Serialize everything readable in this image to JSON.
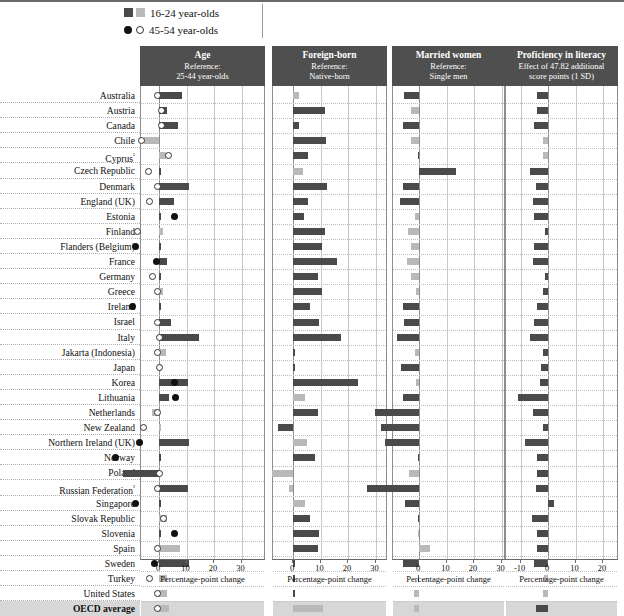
{
  "legend": {
    "items": [
      {
        "icon_dark": "dark-square-icon",
        "icon_light": "light-square-icon",
        "label": "16-24 year-olds"
      },
      {
        "icon_dark": "dark-circle-icon",
        "icon_light": "light-circle-icon",
        "label": "45-54 year-olds"
      }
    ]
  },
  "panels": [
    {
      "title": "Age",
      "sub1": "Reference:",
      "sub2": "25-44 year-olds",
      "axis_title": "Percentage-point change"
    },
    {
      "title": "Foreign-born",
      "sub1": "Reference:",
      "sub2": "Native-born",
      "axis_title": "Percentage-point change"
    },
    {
      "title": "Married women",
      "sub1": "Reference:",
      "sub2": "Single men",
      "axis_title": "Percentage-point change"
    },
    {
      "title": "Proficiency in literacy",
      "sub1": "Effect of 47.82  additional",
      "sub2": "score points (1 SD)",
      "axis_title": "Percentage-point change"
    }
  ],
  "axis_ticks": [
    -20,
    -10,
    0,
    10,
    20,
    30
  ],
  "countries": [
    "Australia",
    "Austria",
    "Canada",
    "Chile",
    "Cyprus¹",
    "Czech Republic",
    "Denmark",
    "England (UK)",
    "Estonia",
    "Finland",
    "Flanders (Belgium)",
    "France",
    "Germany",
    "Greece",
    "Ireland",
    "Israel",
    "Italy",
    "Jakarta (Indonesia)",
    "Japan",
    "Korea",
    "Lithuania",
    "Netherlands",
    "New Zealand",
    "Northern Ireland (UK)",
    "Norway",
    "Poland",
    "Russian Federation²",
    "Singapore",
    "Slovak Republic",
    "Slovenia",
    "Spain",
    "Sweden",
    "Turkey",
    "United States",
    "OECD average"
  ],
  "colors": {
    "dark": "#4a4a4a",
    "light": "#b9b9b9",
    "header_bg": "#4f4f4f",
    "avg_band": "#d7d7d7",
    "grid": "#c9c9c9",
    "zero_line": "#8e8e8e"
  },
  "chart_data": {
    "type": "bar",
    "title": "",
    "xlabel": "Percentage-point change",
    "ylabel": "",
    "xlim": [
      -20,
      30
    ],
    "grid": true,
    "legend": "top",
    "note": "Four side-by-side panels. Bars = 16-24 year-olds (dark = significant, light = not significant). Circles in Age panel = 45-54 year-olds (filled = significant, hollow = not significant).",
    "categories": [
      "Australia",
      "Austria",
      "Canada",
      "Chile",
      "Cyprus",
      "Czech Republic",
      "Denmark",
      "England (UK)",
      "Estonia",
      "Finland",
      "Flanders (Belgium)",
      "France",
      "Germany",
      "Greece",
      "Ireland",
      "Israel",
      "Italy",
      "Jakarta (Indonesia)",
      "Japan",
      "Korea",
      "Lithuania",
      "Netherlands",
      "New Zealand",
      "Northern Ireland (UK)",
      "Norway",
      "Poland",
      "Russian Federation",
      "Singapore",
      "Slovak Republic",
      "Slovenia",
      "Spain",
      "Sweden",
      "Turkey",
      "United States",
      "OECD average"
    ],
    "panels": [
      {
        "name": "Age",
        "reference": "25-44 year-olds",
        "series": [
          {
            "name": "16-24 year-olds (bar)",
            "values": [
              8.5,
              3.0,
              7.0,
              -5.5,
              2.5,
              0.5,
              11.0,
              5.5,
              0.5,
              1.5,
              0.5,
              3.0,
              0.0,
              1.5,
              0.0,
              4.5,
              14.5,
              2.5,
              0.5,
              10.5,
              3.5,
              -2.5,
              0.5,
              11.0,
              0.5,
              -13.0,
              10.5,
              0.0,
              3.0,
              0.5,
              7.5,
              11.0,
              3.0,
              3.0,
              3.5
            ],
            "significance": [
              "dark",
              "dark",
              "dark",
              "light",
              "light",
              "dark",
              "dark",
              "dark",
              "dark",
              "light",
              "dark",
              "dark",
              "dark",
              "light",
              "dark",
              "dark",
              "dark",
              "light",
              "dark",
              "dark",
              "dark",
              "light",
              "light",
              "dark",
              "dark",
              "dark",
              "dark",
              "dark",
              "light",
              "dark",
              "light",
              "dark",
              "light",
              "light",
              "light"
            ]
          },
          {
            "name": "45-54 year-olds (marker)",
            "values": [
              -0.5,
              0.8,
              0.8,
              -6.5,
              3.5,
              -4.0,
              -0.5,
              -3.5,
              5.5,
              -8.0,
              -8.5,
              -1.0,
              -2.5,
              -0.5,
              -9.5,
              -0.5,
              0.0,
              -0.5,
              0.0,
              5.5,
              6.0,
              -0.5,
              -5.5,
              -7.0,
              -16.0,
              0.0,
              -0.5,
              -8.5,
              1.5,
              5.5,
              -0.5,
              -1.5,
              -3.5,
              -0.5,
              -0.5
            ],
            "significance": [
              "light",
              "light",
              "light",
              "light",
              "light",
              "light",
              "light",
              "light",
              "dark",
              "light",
              "dark",
              "dark",
              "light",
              "light",
              "dark",
              "light",
              "light",
              "light",
              "light",
              "dark",
              "dark",
              "light",
              "light",
              "dark",
              "dark",
              "light",
              "light",
              "dark",
              "light",
              "dark",
              "light",
              "dark",
              "light",
              "light",
              "light"
            ]
          }
        ]
      },
      {
        "name": "Foreign-born",
        "reference": "Native-born",
        "series": [
          {
            "name": "16-24 year-olds (bar)",
            "values": [
              2.0,
              11.5,
              2.0,
              12.0,
              5.5,
              3.5,
              12.5,
              5.5,
              4.0,
              11.5,
              10.5,
              16.0,
              9.0,
              10.5,
              6.0,
              9.5,
              17.5,
              0.0,
              0.0,
              23.5,
              4.5,
              9.0,
              -5.5,
              5.0,
              8.0,
              -7.5,
              -1.5,
              4.5,
              6.0,
              9.5,
              9.0,
              0.5,
              0.0,
              0.0,
              11.0
            ],
            "significance": [
              "light",
              "dark",
              "dark",
              "dark",
              "dark",
              "light",
              "dark",
              "dark",
              "dark",
              "dark",
              "dark",
              "dark",
              "dark",
              "dark",
              "dark",
              "dark",
              "dark",
              "dark",
              "dark",
              "dark",
              "light",
              "dark",
              "dark",
              "light",
              "dark",
              "light",
              "light",
              "light",
              "dark",
              "dark",
              "dark",
              "dark",
              "dark",
              "dark",
              "light"
            ]
          }
        ]
      },
      {
        "name": "Married women",
        "reference": "Single men",
        "series": [
          {
            "name": "16-24 year-olds (bar)",
            "values": [
              -5.5,
              -3.0,
              -6.0,
              -3.0,
              -0.5,
              13.5,
              -6.0,
              -7.0,
              -1.5,
              -4.0,
              -3.0,
              -4.5,
              -3.0,
              -1.0,
              -6.0,
              -5.5,
              -8.0,
              -1.5,
              -6.5,
              -1.0,
              -6.0,
              -16.0,
              -14.0,
              -12.5,
              -0.5,
              -3.5,
              -19.0,
              -5.0,
              -0.5,
              -0.5,
              4.0,
              -6.0,
              -0.5,
              -2.0,
              -2.0
            ],
            "significance": [
              "dark",
              "light",
              "dark",
              "light",
              "dark",
              "dark",
              "dark",
              "dark",
              "light",
              "light",
              "light",
              "light",
              "light",
              "light",
              "dark",
              "dark",
              "dark",
              "light",
              "dark",
              "light",
              "dark",
              "dark",
              "dark",
              "dark",
              "dark",
              "light",
              "dark",
              "dark",
              "dark",
              "light",
              "light",
              "dark",
              "dark",
              "light",
              "light"
            ]
          }
        ]
      },
      {
        "name": "Proficiency in literacy",
        "reference": "Effect of 47.82 additional score points (1 SD)",
        "series": [
          {
            "name": "16-24 year-olds (bar)",
            "values": [
              -4.0,
              -4.0,
              -5.0,
              -2.0,
              -2.0,
              -6.5,
              -4.5,
              -5.5,
              -5.0,
              -1.0,
              -5.0,
              -5.5,
              -1.0,
              -2.0,
              -4.0,
              -5.0,
              -6.5,
              -2.0,
              -2.5,
              -3.0,
              -11.0,
              -5.5,
              -2.0,
              -8.5,
              -4.0,
              -4.0,
              -4.5,
              2.0,
              -6.0,
              -4.0,
              -4.0,
              -5.0,
              -1.5,
              -2.0,
              -4.5
            ],
            "significance": [
              "dark",
              "dark",
              "dark",
              "light",
              "light",
              "dark",
              "dark",
              "dark",
              "dark",
              "dark",
              "dark",
              "dark",
              "dark",
              "dark",
              "dark",
              "dark",
              "dark",
              "dark",
              "dark",
              "dark",
              "dark",
              "dark",
              "dark",
              "dark",
              "dark",
              "dark",
              "dark",
              "dark",
              "dark",
              "dark",
              "dark",
              "dark",
              "light",
              "light",
              "dark"
            ]
          }
        ]
      }
    ]
  }
}
